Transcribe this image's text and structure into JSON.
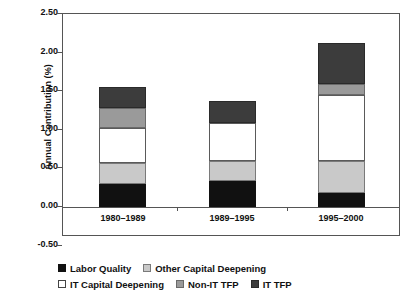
{
  "chart_data": {
    "type": "bar",
    "subtype": "stacked-vertical",
    "title": "",
    "xlabel": "",
    "ylabel": "Annual Contribution (%)",
    "categories": [
      "1980–1989",
      "1989–1995",
      "1995–2000"
    ],
    "ylim": [
      -0.5,
      2.5
    ],
    "ytick_labels": [
      "2.50",
      "2.00",
      "1.50",
      "1.00",
      "0.50",
      "0.00",
      "-0.50"
    ],
    "ytick_values": [
      2.5,
      2.0,
      1.5,
      1.0,
      0.5,
      0.0,
      -0.5
    ],
    "grid": false,
    "legend_position": "below",
    "series": [
      {
        "name": "Labor Quality",
        "key": "labor",
        "color": "#111111",
        "values": [
          0.3,
          0.34,
          0.18
        ]
      },
      {
        "name": "Other Capital Deepening",
        "key": "other",
        "color": "#c9c9c9",
        "values": [
          0.27,
          0.26,
          0.42
        ]
      },
      {
        "name": "IT Capital Deepening",
        "key": "itcap",
        "color": "#ffffff",
        "values": [
          0.45,
          0.49,
          0.85
        ]
      },
      {
        "name": "Non-IT TFP",
        "key": "nonit",
        "color": "#9a9a9a",
        "values": [
          0.26,
          0.0,
          0.14
        ]
      },
      {
        "name": "IT TFP",
        "key": "ittfp",
        "color": "#3c3c3c",
        "values": [
          0.28,
          0.29,
          0.53
        ]
      }
    ],
    "totals": [
      1.56,
      1.38,
      2.12
    ]
  },
  "legend": {
    "row1": [
      {
        "label": "Labor Quality",
        "swatch": "sw-labor"
      },
      {
        "label": "Other Capital Deepening",
        "swatch": "sw-other"
      }
    ],
    "row2": [
      {
        "label": "IT Capital Deepening",
        "swatch": "sw-itcap"
      },
      {
        "label": "Non-IT TFP",
        "swatch": "sw-nonit"
      },
      {
        "label": "IT TFP",
        "swatch": "sw-ittfp"
      }
    ]
  }
}
